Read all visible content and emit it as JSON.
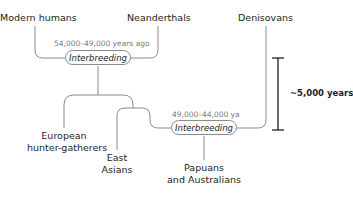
{
  "diagram": {
    "groups": {
      "modern_humans": "Modern humans",
      "neanderthals": "Neanderthals",
      "denisovans": "Denisovans",
      "european": [
        "European",
        "hunter-gatherers"
      ],
      "east_asians": [
        "East",
        "Asians"
      ],
      "papuans": [
        "Papuans",
        "and Australians"
      ]
    },
    "events": [
      {
        "label": "Interbreeding",
        "date": "54,000–49,000 years ago"
      },
      {
        "label": "Interbreeding",
        "date": "49,000–44,000 ya"
      }
    ],
    "scale_bar": {
      "label": "~5,000 years"
    },
    "colors": {
      "line": "#8a8a8a",
      "scale": "#1e1e1e",
      "date": "#7a7a7a"
    }
  }
}
